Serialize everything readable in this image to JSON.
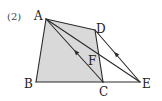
{
  "problem_label": "(2)",
  "colors": {
    "stroke": "#2a2a2a",
    "fill": "#d9d9d9",
    "text": "#222222"
  },
  "points": {
    "A": {
      "label": "A",
      "x": 46,
      "y": 19
    },
    "B": {
      "label": "B",
      "x": 36,
      "y": 82
    },
    "C": {
      "label": "C",
      "x": 103,
      "y": 82
    },
    "D": {
      "label": "D",
      "x": 95,
      "y": 30
    },
    "E": {
      "label": "E",
      "x": 140,
      "y": 82
    },
    "F": {
      "label": "F",
      "x": 98,
      "y": 57
    }
  },
  "shaded_region": [
    "A",
    "B",
    "C",
    "D"
  ],
  "segments": [
    [
      "A",
      "B"
    ],
    [
      "B",
      "C"
    ],
    [
      "C",
      "E"
    ],
    [
      "A",
      "D"
    ],
    [
      "D",
      "C"
    ],
    [
      "A",
      "C"
    ],
    [
      "A",
      "E"
    ],
    [
      "D",
      "E"
    ]
  ],
  "parallel_marks": [
    {
      "segment": [
        "C",
        "A"
      ],
      "direction": "toward A"
    },
    {
      "segment": [
        "E",
        "D"
      ],
      "direction": "toward D"
    }
  ]
}
